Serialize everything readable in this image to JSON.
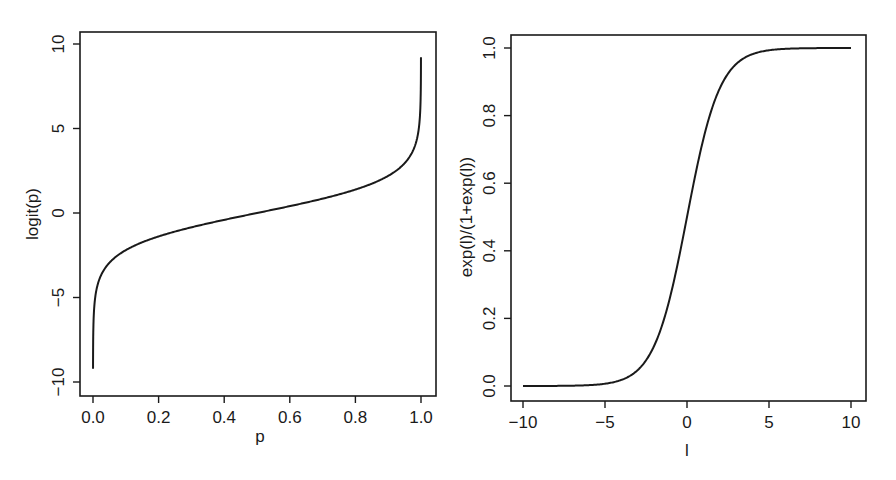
{
  "chart_data": [
    {
      "type": "line",
      "title": "",
      "xlabel": "p",
      "ylabel": "logit(p)",
      "xlim": [
        0,
        1
      ],
      "ylim": [
        -10,
        10
      ],
      "x_ticks": [
        "0.0",
        "0.2",
        "0.4",
        "0.6",
        "0.8",
        "1.0"
      ],
      "y_ticks": [
        "-10",
        "-5",
        "0",
        "5",
        "10"
      ],
      "grid": false,
      "legend": null,
      "series": [
        {
          "name": "logit(p)",
          "function": "log(p/(1-p))",
          "x": [
            0.0001,
            0.001,
            0.01,
            0.02,
            0.05,
            0.1,
            0.2,
            0.3,
            0.4,
            0.5,
            0.6,
            0.7,
            0.8,
            0.9,
            0.95,
            0.98,
            0.99,
            0.999,
            0.9999
          ],
          "values": [
            -9.21,
            -6.91,
            -4.6,
            -3.89,
            -2.94,
            -2.2,
            -1.39,
            -0.85,
            -0.41,
            0.0,
            0.41,
            0.85,
            1.39,
            2.2,
            2.94,
            3.89,
            4.6,
            6.91,
            9.21
          ]
        }
      ]
    },
    {
      "type": "line",
      "title": "",
      "xlabel": "l",
      "ylabel": "exp(l)/(1+exp(l))",
      "xlim": [
        -10,
        10
      ],
      "ylim": [
        0,
        1
      ],
      "x_ticks": [
        "-10",
        "-5",
        "0",
        "5",
        "10"
      ],
      "y_ticks": [
        "0.0",
        "0.2",
        "0.4",
        "0.6",
        "0.8",
        "1.0"
      ],
      "grid": false,
      "legend": null,
      "series": [
        {
          "name": "exp(l)/(1+exp(l))",
          "function": "exp(l)/(1+exp(l))",
          "x": [
            -10,
            -8,
            -6,
            -5,
            -4,
            -3,
            -2,
            -1,
            0,
            1,
            2,
            3,
            4,
            5,
            6,
            8,
            10
          ],
          "values": [
            5e-05,
            0.0003,
            0.0025,
            0.0067,
            0.018,
            0.047,
            0.119,
            0.269,
            0.5,
            0.731,
            0.881,
            0.953,
            0.982,
            0.993,
            0.9975,
            0.9997,
            0.99995
          ]
        }
      ]
    }
  ],
  "left_plot": {
    "xlabel": "p",
    "ylabel": "logit(p)",
    "x_ticks": [
      "0.0",
      "0.2",
      "0.4",
      "0.6",
      "0.8",
      "1.0"
    ],
    "y_ticks": [
      "-10",
      "-5",
      "0",
      "5",
      "10"
    ]
  },
  "right_plot": {
    "xlabel": "l",
    "ylabel": "exp(l)/(1+exp(l))",
    "x_ticks": [
      "-10",
      "-5",
      "0",
      "5",
      "10"
    ],
    "y_ticks": [
      "0.0",
      "0.2",
      "0.4",
      "0.6",
      "0.8",
      "1.0"
    ]
  },
  "colors": {
    "line": "#1a1a1a",
    "background": "#ffffff"
  }
}
